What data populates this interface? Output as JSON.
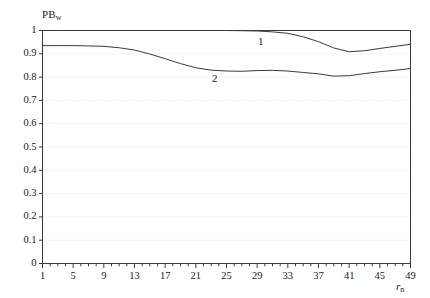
{
  "chart_data": {
    "type": "line",
    "title": "",
    "xlabel": "r_n",
    "ylabel": "PB_w",
    "xlim": [
      1,
      49
    ],
    "ylim": [
      0,
      1
    ],
    "grid": true,
    "grid_orientation": "horizontal",
    "legend_position": "inline-annotations",
    "x_tick_labels": [
      "1",
      "5",
      "9",
      "13",
      "17",
      "21",
      "25",
      "29",
      "33",
      "37",
      "41",
      "45",
      "49"
    ],
    "x_tick_values": [
      1,
      5,
      9,
      13,
      17,
      21,
      25,
      29,
      33,
      37,
      41,
      45,
      49
    ],
    "x_minor_tick_step": 1,
    "y_tick_labels": [
      "0",
      "0.1",
      "0.2",
      "0.3",
      "0.4",
      "0.5",
      "0.6",
      "0.7",
      "0.8",
      "0.9",
      "1"
    ],
    "y_tick_values": [
      0,
      0.1,
      0.2,
      0.3,
      0.4,
      0.5,
      0.6,
      0.7,
      0.8,
      0.9,
      1
    ],
    "x": [
      1,
      3,
      5,
      7,
      9,
      11,
      13,
      15,
      17,
      19,
      21,
      23,
      25,
      27,
      29,
      31,
      33,
      35,
      37,
      39,
      41,
      43,
      45,
      47,
      49
    ],
    "series": [
      {
        "name": "1",
        "label": "1",
        "color": "#3a3a3a",
        "annotation_x": 29.5,
        "annotation_y": 0.955,
        "values": [
          1.0,
          1.0,
          1.0,
          1.0,
          1.0,
          1.0,
          1.0,
          1.0,
          1.0,
          1.0,
          1.0,
          1.0,
          1.0,
          0.999,
          0.998,
          0.994,
          0.988,
          0.973,
          0.952,
          0.925,
          0.909,
          0.913,
          0.923,
          0.932,
          0.941
        ]
      },
      {
        "name": "2",
        "label": "2",
        "color": "#3a3a3a",
        "annotation_x": 23.5,
        "annotation_y": 0.795,
        "values": [
          0.935,
          0.935,
          0.935,
          0.934,
          0.932,
          0.926,
          0.916,
          0.899,
          0.879,
          0.858,
          0.84,
          0.83,
          0.826,
          0.825,
          0.828,
          0.829,
          0.826,
          0.82,
          0.814,
          0.804,
          0.806,
          0.815,
          0.823,
          0.829,
          0.837
        ]
      }
    ]
  },
  "axes": {
    "frame_color": "#3a3a3a",
    "grid_color": "#e4e9f0"
  }
}
